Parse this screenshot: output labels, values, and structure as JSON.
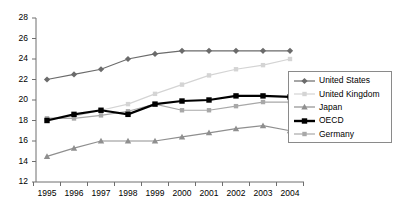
{
  "chart_data": {
    "type": "line",
    "title": "",
    "xlabel": "",
    "ylabel": "",
    "x": [
      1995,
      1996,
      1997,
      1998,
      1999,
      2000,
      2001,
      2002,
      2003,
      2004
    ],
    "categories": [
      "1995",
      "1996",
      "1997",
      "1998",
      "1999",
      "2000",
      "2001",
      "2002",
      "2003",
      "2004"
    ],
    "ylim": [
      12,
      28
    ],
    "ytick_values": [
      12,
      14,
      16,
      18,
      20,
      22,
      24,
      26,
      28
    ],
    "ytick_labels": [
      "12",
      "14",
      "16",
      "18",
      "20",
      "22",
      "24",
      "26",
      "28"
    ],
    "grid": false,
    "legend_position": "right",
    "series": [
      {
        "name": "United States",
        "color": "#6b6b6b",
        "marker": "diamond",
        "line_width": 1.2,
        "values": [
          22.0,
          22.5,
          23.0,
          24.0,
          24.5,
          24.8,
          24.8,
          24.8,
          24.8,
          24.8
        ]
      },
      {
        "name": "United Kingdom",
        "color": "#d4d4d4",
        "marker": "square",
        "line_width": 1.2,
        "values": [
          18.2,
          18.4,
          19.0,
          19.6,
          20.6,
          21.5,
          22.4,
          23.0,
          23.4,
          24.0
        ]
      },
      {
        "name": "Japan",
        "color": "#8f8f8f",
        "marker": "triangle",
        "line_width": 1.2,
        "values": [
          14.5,
          15.3,
          16.0,
          16.0,
          16.0,
          16.4,
          16.8,
          17.2,
          17.5,
          17.0
        ]
      },
      {
        "name": "OECD",
        "color": "#000000",
        "marker": "square",
        "line_width": 2.2,
        "values": [
          18.0,
          18.6,
          19.0,
          18.6,
          19.6,
          19.9,
          20.0,
          20.4,
          20.4,
          20.3
        ]
      },
      {
        "name": "Germany",
        "color": "#a8a8a8",
        "marker": "square",
        "line_width": 1.2,
        "values": [
          18.2,
          18.2,
          18.5,
          18.9,
          19.6,
          19.0,
          19.0,
          19.4,
          19.8,
          19.8
        ]
      }
    ]
  },
  "legend": {
    "items": [
      {
        "label": "United States"
      },
      {
        "label": "United Kingdom"
      },
      {
        "label": "Japan"
      },
      {
        "label": "OECD"
      },
      {
        "label": "Germany"
      }
    ]
  },
  "axes": {
    "y_labels": [
      "28",
      "26",
      "24",
      "22",
      "20",
      "18",
      "16",
      "14",
      "12"
    ],
    "x_labels": [
      "1995",
      "1996",
      "1997",
      "1998",
      "1999",
      "2000",
      "2001",
      "2002",
      "2003",
      "2004"
    ]
  }
}
